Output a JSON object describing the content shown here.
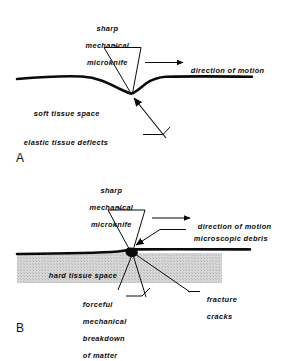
{
  "figure": {
    "type": "scientific-line-diagram",
    "background_color": "#ffffff",
    "ink_color": "#0b0b0b",
    "tissue_fill_color": "#d4d4d4",
    "panels": [
      {
        "id": "A",
        "letter": "A",
        "subject": "sharp mechanical microknife cutting soft tissue",
        "labels": [
          "sharp",
          "mechanical",
          "microknife",
          "direction of motion",
          "soft tissue space",
          "elastic tissue deflects"
        ]
      },
      {
        "id": "B",
        "letter": "B",
        "subject": "sharp mechanical microknife cutting hard tissue",
        "labels": [
          "sharp",
          "mechanical",
          "microknife",
          "direction of motion",
          "microscopic debris",
          "hard tissue space",
          "fracture cracks",
          "forceful mechanical breakdown of matter"
        ]
      }
    ]
  },
  "panelA": {
    "letter": "A",
    "knife_label_line1": "sharp",
    "knife_label_line2": "mechanical",
    "knife_label_line3": "microknife",
    "direction_label": "direction of motion",
    "space_label": "soft tissue space",
    "deflect_label": "elastic tissue deflects"
  },
  "panelB": {
    "letter": "B",
    "knife_label_line1": "sharp",
    "knife_label_line2": "mechanical",
    "knife_label_line3": "microknife",
    "direction_label": "direction of motion",
    "debris_label": "microscopic debris",
    "space_label": "hard tissue space",
    "fracture_line1": "fracture",
    "fracture_line2": "cracks",
    "breakdown_line1": "forceful",
    "breakdown_line2": "mechanical",
    "breakdown_line3": "breakdown",
    "breakdown_line4": "of matter"
  }
}
